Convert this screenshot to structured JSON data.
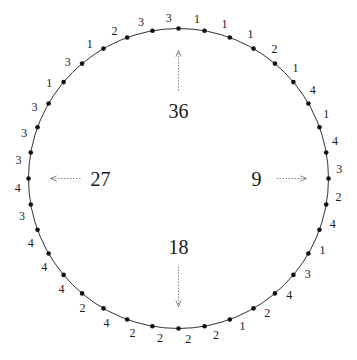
{
  "diagram": {
    "circle": {
      "cx": 178.5,
      "cy": 178.5,
      "r": 150,
      "stroke": "#333333"
    },
    "dot_color": "#111111",
    "arrow_color": "#777777",
    "positions_clockwise_from_top": [
      3,
      1,
      1,
      1,
      2,
      1,
      4,
      1,
      4,
      3,
      2,
      4,
      1,
      3,
      4,
      2,
      1,
      2,
      2,
      2,
      2,
      4,
      2,
      4,
      4,
      4,
      3,
      4,
      3,
      3,
      3,
      1,
      3,
      1,
      2,
      3
    ],
    "direction_labels": [
      {
        "text": "36",
        "angle_deg": 0
      },
      {
        "text": "9",
        "angle_deg": 90
      },
      {
        "text": "18",
        "angle_deg": 180
      },
      {
        "text": "27",
        "angle_deg": 270
      }
    ]
  }
}
